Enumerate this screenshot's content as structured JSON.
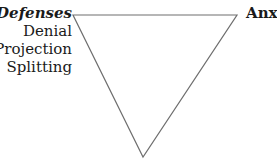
{
  "diagram": {
    "type": "inverted-triangle",
    "corners": {
      "top_left": {
        "title": "Defenses",
        "items": [
          "Denial",
          "Projection",
          "Splitting"
        ]
      },
      "top_right": {
        "title": "Anxiety"
      }
    },
    "line_color": "#6e6e6e"
  }
}
